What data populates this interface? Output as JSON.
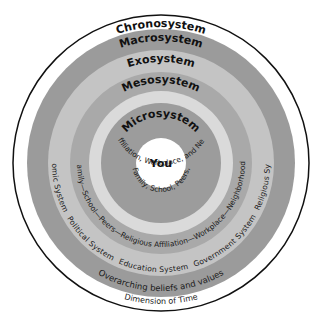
{
  "diagram": {
    "colors": {
      "background": "#ffffff",
      "chrono_ring": "#ffffff",
      "outline": "#111111",
      "macro_ring": "#9b9b9b",
      "exo_ring": "#c4c4c4",
      "meso_ring": "#a9a9a9",
      "meso_inner_band": "#dadada",
      "micro_ring": "#9c9c9c",
      "you_circle": "#ffffff"
    },
    "rings": [
      {
        "name": "Chronosystem",
        "label": "Chronosystem",
        "detail": "Dimension of Time"
      },
      {
        "name": "Macrosystem",
        "label": "Macrosystem",
        "detail": "Overarching beliefs and values"
      },
      {
        "name": "Exosystem",
        "label": "Exosystem",
        "detail_items": [
          "Economic System",
          "Political System",
          "Education System",
          "Government System",
          "Religious System"
        ]
      },
      {
        "name": "Mesosystem",
        "label": "Mesosystem",
        "detail": "Family—School—Peers—Religious Affiliation—Workplace—Neighborhood"
      },
      {
        "name": "Microsystem",
        "label": "Microsystem",
        "detail_line1": "Family, School, Peers,",
        "detail_line2": "Religious Affiliation, Workplace, and Neighborhood"
      }
    ],
    "center": {
      "label": "You"
    }
  }
}
